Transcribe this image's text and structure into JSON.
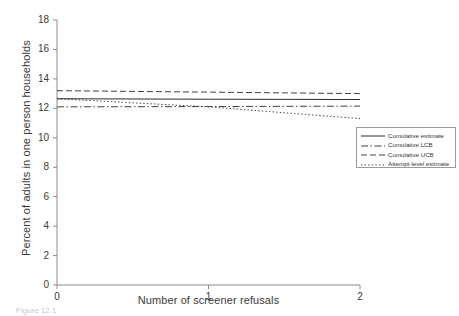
{
  "chart_data": {
    "type": "line",
    "title": "",
    "xlabel": "Number of screener refusals",
    "ylabel": "Percent of adults in one person households",
    "xlim": [
      0,
      2
    ],
    "ylim": [
      0,
      18
    ],
    "xticks": [
      "0",
      "1",
      "2"
    ],
    "yticks": [
      "0",
      "2",
      "4",
      "6",
      "8",
      "10",
      "12",
      "14",
      "16",
      "18"
    ],
    "grid": false,
    "legend_position": "right-middle",
    "x": [
      0,
      1,
      2
    ],
    "series": [
      {
        "name": "Cumulative estimate",
        "style": "solid",
        "values": [
          12.65,
          12.62,
          12.6
        ]
      },
      {
        "name": "Cumulative LCB",
        "style": "dash-dot",
        "values": [
          12.1,
          12.12,
          12.15
        ]
      },
      {
        "name": "Cumulative UCB",
        "style": "dashed",
        "values": [
          13.2,
          13.1,
          13.0
        ]
      },
      {
        "name": "Attempt-level estimate",
        "style": "dotted",
        "values": [
          12.65,
          12.1,
          11.3
        ]
      }
    ]
  },
  "axis": {
    "y_label": "Percent of adults in one person households",
    "x_label": "Number of screener refusals",
    "y_ticks": [
      {
        "value": "18"
      },
      {
        "value": "16"
      },
      {
        "value": "14"
      },
      {
        "value": "12"
      },
      {
        "value": "10"
      },
      {
        "value": "8"
      },
      {
        "value": "6"
      },
      {
        "value": "4"
      },
      {
        "value": "2"
      },
      {
        "value": "0"
      }
    ],
    "x_ticks": [
      {
        "value": "0"
      },
      {
        "value": "1"
      },
      {
        "value": "2"
      }
    ]
  },
  "legend": {
    "entries": [
      {
        "label": "Cumulative estimate"
      },
      {
        "label": "Cumulative LCB"
      },
      {
        "label": "Cumulative UCB"
      },
      {
        "label": "Attempt-level estimate"
      }
    ]
  },
  "caption": {
    "text": "Figure 12.1"
  },
  "colors": {
    "line": "#2b2b2b",
    "axis": "#8c8c8c",
    "text": "#3a3a3a",
    "background": "#ffffff"
  }
}
